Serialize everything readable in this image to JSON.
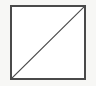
{
  "figure": {
    "canvas": {
      "width": 96,
      "height": 86,
      "background_color": "#f7f7f5"
    },
    "shapes": [
      {
        "name": "square",
        "type": "rectangle",
        "x": 11,
        "y": 6,
        "width": 74,
        "height": 73,
        "stroke_color": "#4a4a4a",
        "stroke_width": 1.2,
        "fill_color": "#ffffff"
      },
      {
        "name": "diagonal",
        "type": "line",
        "x1": 11,
        "y1": 79,
        "x2": 85,
        "y2": 6,
        "stroke_color": "#4a4a4a",
        "stroke_width": 1.1,
        "direction": "bottom-left-to-top-right"
      }
    ],
    "labels": [],
    "caption": ""
  }
}
